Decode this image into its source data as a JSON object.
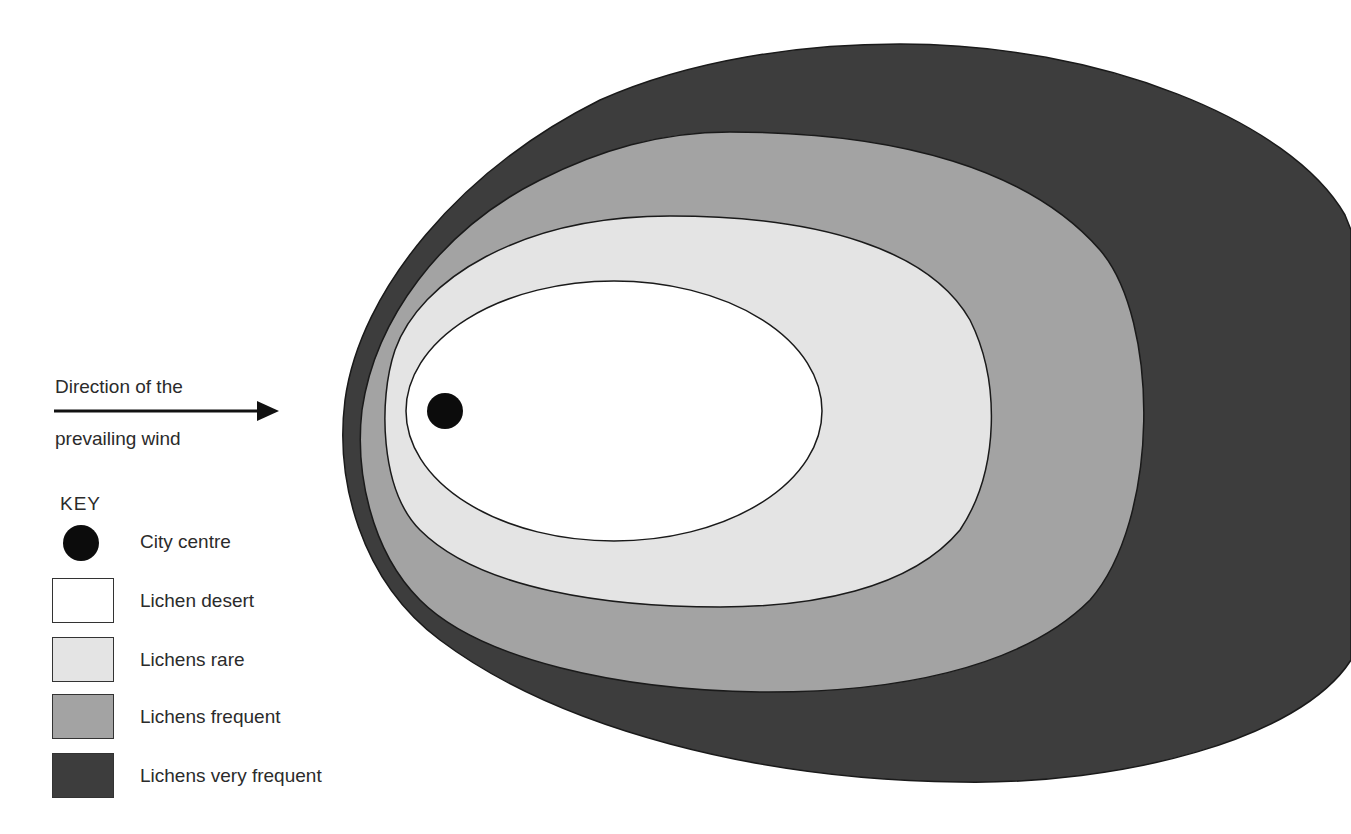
{
  "wind": {
    "line1": "Direction of the",
    "line2": "prevailing wind",
    "icon": "arrow-right-icon"
  },
  "key": {
    "title": "KEY",
    "items": [
      {
        "label": "City centre",
        "symbol": "filled-circle",
        "color": "#0c0c0c"
      },
      {
        "label": "Lichen desert",
        "symbol": "swatch",
        "color": "#ffffff"
      },
      {
        "label": "Lichens rare",
        "symbol": "swatch",
        "color": "#e4e4e4"
      },
      {
        "label": "Lichens frequent",
        "symbol": "swatch",
        "color": "#a3a3a3"
      },
      {
        "label": "Lichens very frequent",
        "symbol": "swatch",
        "color": "#3d3d3d"
      }
    ]
  },
  "zones": [
    {
      "name": "Lichens very frequent",
      "color": "#3d3d3d"
    },
    {
      "name": "Lichens frequent",
      "color": "#a3a3a3"
    },
    {
      "name": "Lichens rare",
      "color": "#e4e4e4"
    },
    {
      "name": "Lichen desert",
      "color": "#ffffff"
    }
  ],
  "city_centre": {
    "label": "City centre",
    "color": "#0c0c0c"
  }
}
